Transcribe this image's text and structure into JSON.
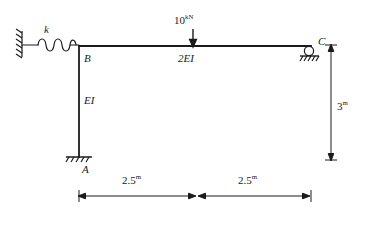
{
  "diagram": {
    "type": "structural-frame-free-body-diagram",
    "stroke_color": "#1a1a1a",
    "background_color": "#ffffff",
    "labels": {
      "spring_stiffness": "k",
      "joint_b": "B",
      "column_flexural_rigidity": "EI",
      "beam_flexural_rigidity": "2EI",
      "support_a": "A",
      "support_c": "C"
    },
    "load": {
      "magnitude": "10",
      "unit": "kN",
      "direction": "down",
      "position_label": "midspan"
    },
    "dimensions": [
      {
        "name": "span-left",
        "value": "2.5",
        "unit": "m",
        "orientation": "horizontal"
      },
      {
        "name": "span-right",
        "value": "2.5",
        "unit": "m",
        "orientation": "horizontal"
      },
      {
        "name": "column-height",
        "value": "3",
        "unit": "m",
        "orientation": "vertical"
      }
    ],
    "supports": [
      {
        "name": "fixed-wall-spring-anchor",
        "kind": "hatched-wall"
      },
      {
        "name": "base-support-a",
        "kind": "pinned-hatched-ground"
      },
      {
        "name": "roller-support-c",
        "kind": "roller-on-hatched-ground"
      }
    ],
    "members": [
      {
        "name": "column-ab",
        "from": "A",
        "to": "B",
        "rigidity": "EI"
      },
      {
        "name": "beam-bc",
        "from": "B",
        "to": "C",
        "rigidity": "2EI"
      },
      {
        "name": "spring-wall-to-b",
        "from": "wall",
        "to": "B",
        "stiffness": "k"
      }
    ]
  }
}
